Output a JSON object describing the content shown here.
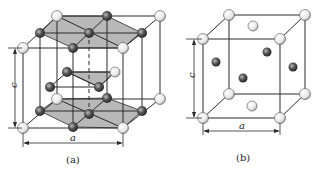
{
  "figure_a": {
    "caption": "(a)",
    "dim_c": "c",
    "dim_a": "a",
    "description": "Hexagonal close-packed (HCP) lattice unit shown within a prism",
    "colors": {
      "plane_fill": "#b8b8b8",
      "light_atom": "#f0f0f0",
      "dark_atom": "#555555"
    }
  },
  "figure_b": {
    "caption": "(b)",
    "dim_c": "c",
    "dim_a": "a",
    "description": "Face-centered tetragonal cell with light corner/top/bottom atoms and dark side-face atoms",
    "colors": {
      "light_atom": "#f0f0f0",
      "dark_atom": "#555555"
    }
  }
}
